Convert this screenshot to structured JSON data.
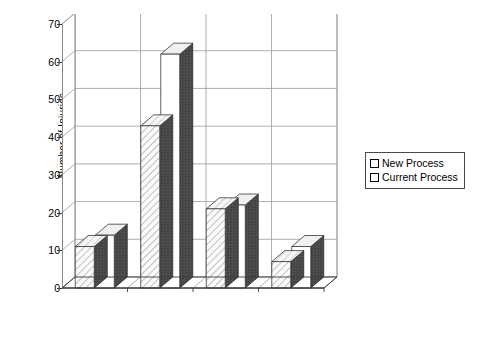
{
  "chart_data": {
    "type": "bar",
    "title": "",
    "subtitle": "",
    "xlabel": "",
    "ylabel": "Number of Injuries",
    "categories": [
      "A-line",
      "DS-line",
      "R-line",
      "DC-line"
    ],
    "series": [
      {
        "name": "New Process",
        "values": [
          11,
          43,
          21,
          7
        ]
      },
      {
        "name": "Current Process",
        "values": [
          14,
          62,
          22,
          11
        ]
      }
    ],
    "ylim": [
      0,
      70
    ],
    "yticks": [
      0,
      10,
      20,
      30,
      40,
      50,
      60,
      70
    ],
    "ytick_labels": [
      "0",
      "10",
      "20",
      "30",
      "40",
      "50",
      "60",
      "70"
    ],
    "grid": true,
    "grid_axis": "y",
    "legend_position": "right",
    "style": "3d-column",
    "colors": {
      "series1_face": "#f2f2f2",
      "series1_hatch": "#8c8c8c",
      "series2_face": "#ffffff",
      "side_dark": "#4a4a4a",
      "top_light": "#f0f0f0",
      "axis": "#3a3a3a",
      "grid": "#9a9a9a",
      "floor": "#585858",
      "text": "#000000",
      "background": "#ffffff"
    }
  },
  "legend": {
    "items": [
      {
        "label": "New Process"
      },
      {
        "label": "Current Process"
      }
    ]
  },
  "axes": {
    "y_title": "Number of Injuries"
  }
}
